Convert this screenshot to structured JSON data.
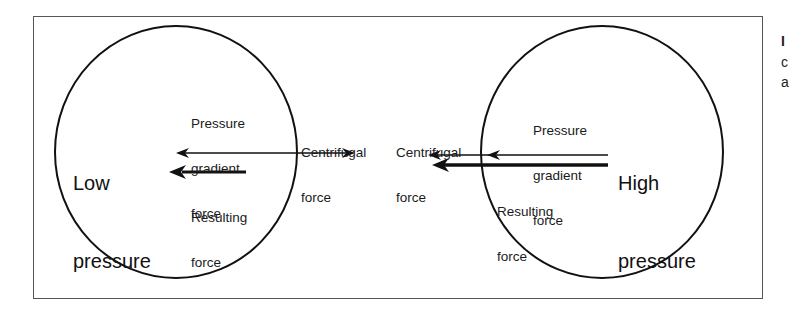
{
  "figure": {
    "low_side": {
      "title_line1": "Low",
      "title_line2": "pressure",
      "pressure_gradient_label": [
        "Pressure",
        "gradient",
        "force"
      ],
      "centrifugal_label": [
        "Centrifugal",
        "force"
      ],
      "resulting_label": [
        "Resulting",
        "force"
      ]
    },
    "high_side": {
      "title_line1": "High",
      "title_line2": "pressure",
      "pressure_gradient_label": [
        "Pressure",
        "gradient",
        "force"
      ],
      "centrifugal_label": [
        "Centrifugal",
        "force"
      ],
      "resulting_label": [
        "Resulting",
        "force"
      ]
    },
    "cropped_text_fragments": [
      "I",
      "c",
      "a"
    ],
    "colors": {
      "line": "#111111",
      "frame": "#555555",
      "background": "#ffffff"
    }
  }
}
